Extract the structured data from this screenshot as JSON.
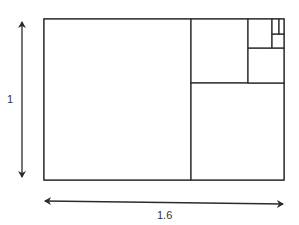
{
  "diagram": {
    "height_label": "1",
    "width_label": "1.6",
    "aspect_ratio": 1.6,
    "squares": [
      {
        "name": "largest-square",
        "order": 1
      },
      {
        "name": "square-2",
        "order": 2
      },
      {
        "name": "square-3",
        "order": 3
      },
      {
        "name": "square-4",
        "order": 4
      },
      {
        "name": "square-5",
        "order": 5
      },
      {
        "name": "square-6",
        "order": 6
      },
      {
        "name": "square-7",
        "order": 7
      }
    ],
    "line_color": "#2b2b2b",
    "background_color": "#ffffff"
  }
}
